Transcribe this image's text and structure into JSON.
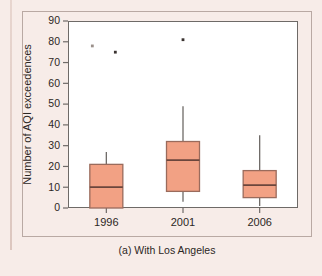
{
  "caption": "(a) With Los Angeles",
  "chart_data": {
    "type": "box",
    "title": "",
    "subtitle": "",
    "xlabel": "",
    "ylabel": "Number of AQI exceedences",
    "categories": [
      "1996",
      "2001",
      "2006"
    ],
    "ylim": [
      0,
      90
    ],
    "yticks": [
      0,
      10,
      20,
      30,
      40,
      50,
      60,
      70,
      80,
      90
    ],
    "ytick_labels": [
      "0",
      "10",
      "20",
      "30",
      "40",
      "50",
      "60",
      "70",
      "80",
      "90"
    ],
    "grid": false,
    "legend": null,
    "boxes": [
      {
        "category": "1996",
        "whisker_low": 0,
        "q1": 0,
        "median": 10,
        "q3": 21,
        "whisker_high": 27,
        "outliers": [
          78,
          75
        ]
      },
      {
        "category": "2001",
        "whisker_low": 3,
        "q1": 8,
        "median": 23,
        "q3": 32,
        "whisker_high": 49,
        "outliers": [
          81
        ]
      },
      {
        "category": "2006",
        "whisker_low": 1,
        "q1": 5,
        "median": 11,
        "q3": 18,
        "whisker_high": 35,
        "outliers": []
      }
    ]
  },
  "colors": {
    "box_fill": "#f2a184",
    "box_stroke": "#9a6b5c",
    "median": "#6b463c",
    "whisker": "#6e6a67",
    "panel_bg": "#ffffff",
    "page_bg": "#f7ece8",
    "text": "#2c2724"
  }
}
